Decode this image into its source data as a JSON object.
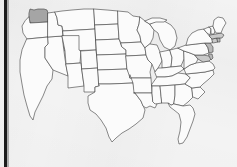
{
  "image": {
    "title": "United States map with Washington state highlighted",
    "width": 237,
    "height": 167
  },
  "canvas": {
    "background_color": "#f3f3f3",
    "left_bar_color": "#1b1b1b"
  },
  "map": {
    "type": "choropleth-outline",
    "country": "United States",
    "outline_color": "#4a4a4a",
    "state_fill_color": "#fbfbfb",
    "highlight_fill_color": "#a5a5a5",
    "highlighted_states": [
      "Washington"
    ],
    "shaded_states": [
      "Massachusetts",
      "Connecticut",
      "Rhode Island",
      "New Jersey",
      "Delaware",
      "Maryland"
    ],
    "states": [
      {
        "id": "WA",
        "name": "Washington",
        "highlighted": true
      },
      {
        "id": "OR",
        "name": "Oregon",
        "highlighted": false
      },
      {
        "id": "CA",
        "name": "California",
        "highlighted": false
      },
      {
        "id": "NV",
        "name": "Nevada",
        "highlighted": false
      },
      {
        "id": "ID",
        "name": "Idaho",
        "highlighted": false
      },
      {
        "id": "MT",
        "name": "Montana",
        "highlighted": false
      },
      {
        "id": "WY",
        "name": "Wyoming",
        "highlighted": false
      },
      {
        "id": "UT",
        "name": "Utah",
        "highlighted": false
      },
      {
        "id": "AZ",
        "name": "Arizona",
        "highlighted": false
      },
      {
        "id": "CO",
        "name": "Colorado",
        "highlighted": false
      },
      {
        "id": "NM",
        "name": "New Mexico",
        "highlighted": false
      },
      {
        "id": "ND",
        "name": "North Dakota",
        "highlighted": false
      },
      {
        "id": "SD",
        "name": "South Dakota",
        "highlighted": false
      },
      {
        "id": "NE",
        "name": "Nebraska",
        "highlighted": false
      },
      {
        "id": "KS",
        "name": "Kansas",
        "highlighted": false
      },
      {
        "id": "OK",
        "name": "Oklahoma",
        "highlighted": false
      },
      {
        "id": "TX",
        "name": "Texas",
        "highlighted": false
      },
      {
        "id": "MN",
        "name": "Minnesota",
        "highlighted": false
      },
      {
        "id": "IA",
        "name": "Iowa",
        "highlighted": false
      },
      {
        "id": "MO",
        "name": "Missouri",
        "highlighted": false
      },
      {
        "id": "AR",
        "name": "Arkansas",
        "highlighted": false
      },
      {
        "id": "LA",
        "name": "Louisiana",
        "highlighted": false
      },
      {
        "id": "WI",
        "name": "Wisconsin",
        "highlighted": false
      },
      {
        "id": "IL",
        "name": "Illinois",
        "highlighted": false
      },
      {
        "id": "MI",
        "name": "Michigan",
        "highlighted": false
      },
      {
        "id": "IN",
        "name": "Indiana",
        "highlighted": false
      },
      {
        "id": "OH",
        "name": "Ohio",
        "highlighted": false
      },
      {
        "id": "KY",
        "name": "Kentucky",
        "highlighted": false
      },
      {
        "id": "TN",
        "name": "Tennessee",
        "highlighted": false
      },
      {
        "id": "MS",
        "name": "Mississippi",
        "highlighted": false
      },
      {
        "id": "AL",
        "name": "Alabama",
        "highlighted": false
      },
      {
        "id": "GA",
        "name": "Georgia",
        "highlighted": false
      },
      {
        "id": "FL",
        "name": "Florida",
        "highlighted": false
      },
      {
        "id": "SC",
        "name": "South Carolina",
        "highlighted": false
      },
      {
        "id": "NC",
        "name": "North Carolina",
        "highlighted": false
      },
      {
        "id": "VA",
        "name": "Virginia",
        "highlighted": false
      },
      {
        "id": "WV",
        "name": "West Virginia",
        "highlighted": false
      },
      {
        "id": "MD",
        "name": "Maryland",
        "highlighted": false
      },
      {
        "id": "DE",
        "name": "Delaware",
        "highlighted": false
      },
      {
        "id": "PA",
        "name": "Pennsylvania",
        "highlighted": false
      },
      {
        "id": "NJ",
        "name": "New Jersey",
        "highlighted": false
      },
      {
        "id": "NY",
        "name": "New York",
        "highlighted": false
      },
      {
        "id": "CT",
        "name": "Connecticut",
        "highlighted": false
      },
      {
        "id": "RI",
        "name": "Rhode Island",
        "highlighted": false
      },
      {
        "id": "MA",
        "name": "Massachusetts",
        "highlighted": false
      },
      {
        "id": "VT",
        "name": "Vermont",
        "highlighted": false
      },
      {
        "id": "NH",
        "name": "New Hampshire",
        "highlighted": false
      },
      {
        "id": "ME",
        "name": "Maine",
        "highlighted": false
      }
    ]
  }
}
